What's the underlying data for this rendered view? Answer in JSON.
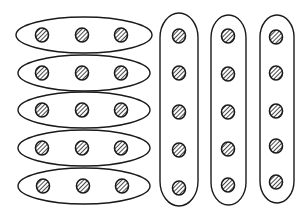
{
  "diagram": {
    "colors": {
      "stroke": "#1a1a1a",
      "background": "#ffffff",
      "dot_fill": "#ffffff",
      "hatch": "#1a1a1a"
    },
    "horizontal_groups": [
      {
        "id": "row-1",
        "cx": 84,
        "cy": 35,
        "rx": 68,
        "ry": 18,
        "dots": [
          42,
          82,
          121
        ]
      },
      {
        "id": "row-2",
        "cx": 84,
        "cy": 73,
        "rx": 66,
        "ry": 18,
        "dots": [
          42,
          82,
          121
        ]
      },
      {
        "id": "row-3",
        "cx": 84,
        "cy": 110,
        "rx": 66,
        "ry": 18,
        "dots": [
          42,
          82,
          121
        ]
      },
      {
        "id": "row-4",
        "cx": 84,
        "cy": 148,
        "rx": 66,
        "ry": 18,
        "dots": [
          42,
          82,
          121
        ]
      },
      {
        "id": "row-5",
        "cx": 84,
        "cy": 186,
        "rx": 66,
        "ry": 18,
        "dots": [
          43,
          83,
          122
        ]
      }
    ],
    "vertical_groups": [
      {
        "id": "col-1",
        "x": 160,
        "y": 13,
        "w": 38,
        "h": 193,
        "cx": 179,
        "dots": [
          36,
          73,
          112,
          150,
          188
        ]
      },
      {
        "id": "col-2",
        "x": 211,
        "y": 15,
        "w": 35,
        "h": 190,
        "cx": 228,
        "dots": [
          36,
          74,
          112,
          149,
          185
        ]
      },
      {
        "id": "col-3",
        "x": 260,
        "y": 15,
        "w": 34,
        "h": 188,
        "cx": 276,
        "dots": [
          37,
          73,
          111,
          146,
          182
        ]
      }
    ],
    "dot_radius": 7
  }
}
